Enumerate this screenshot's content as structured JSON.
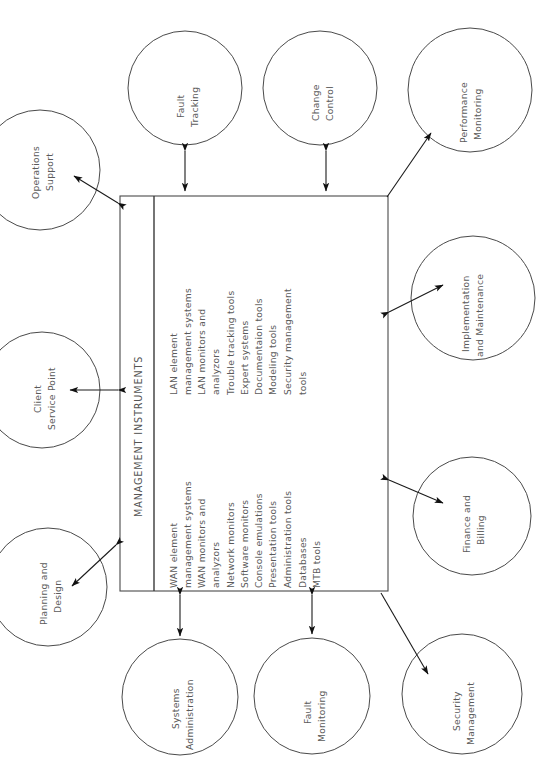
{
  "diagram": {
    "title": "MANAGEMENT INSTRUMENTS",
    "orientation": "rotated-90-ccw",
    "center_box": {
      "label": "MANAGEMENT INSTRUMENTS",
      "columns": [
        {
          "name": "wan-column",
          "items": [
            "WAN element",
            "management systems",
            "WAN monitors and",
            "analyzors",
            "Network monitors",
            "Software monitors",
            "Console emulations",
            "Presentation tools",
            "Administration tools",
            "Databases",
            "MTB tools"
          ]
        },
        {
          "name": "lan-column",
          "items": [
            "LAN element",
            "management systems",
            "LAN monitors and",
            "analyzors",
            "Trouble tracking tools",
            "Expert systems",
            "Documentaion tools",
            "Modeling tools",
            "Security management",
            "tools"
          ]
        }
      ]
    },
    "nodes": [
      {
        "id": "fault-tracking",
        "lines": [
          "Fault",
          "Tracking"
        ]
      },
      {
        "id": "change-control",
        "lines": [
          "Change",
          "Control"
        ]
      },
      {
        "id": "performance-monitoring",
        "lines": [
          "Performance",
          "Monitoring"
        ]
      },
      {
        "id": "implementation-and-maintenance",
        "lines": [
          "Implementation",
          "and Maintenance"
        ]
      },
      {
        "id": "finance-and-billing",
        "lines": [
          "Finance and",
          "Billing"
        ]
      },
      {
        "id": "security-management",
        "lines": [
          "Security",
          "Management"
        ]
      },
      {
        "id": "fault-monitoring",
        "lines": [
          "Fault",
          "Monitoring"
        ]
      },
      {
        "id": "systems-administration",
        "lines": [
          "Systems",
          "Administration"
        ]
      },
      {
        "id": "planning-and-design",
        "lines": [
          "Planning and",
          "Design"
        ]
      },
      {
        "id": "client-service-point",
        "lines": [
          "Client",
          "Service Point"
        ]
      },
      {
        "id": "operations-support",
        "lines": [
          "Operations",
          "Support"
        ]
      }
    ],
    "colors": {
      "stroke": "#4a4a4a",
      "text": "#5a5a5a",
      "arrow": "#111111",
      "background": "#ffffff"
    }
  }
}
